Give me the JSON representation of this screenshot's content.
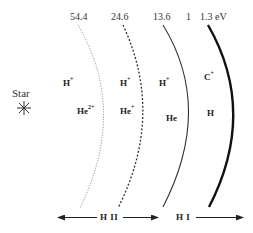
{
  "diagram": {
    "type": "ionization-front-structure",
    "source": {
      "label": "Star",
      "icon": "asterisk-star-icon",
      "glyph": "✳"
    },
    "fronts": [
      {
        "id": "front-54-4",
        "energy_label": "54.4",
        "style": "dotted",
        "weight": "thin",
        "color": "#777777"
      },
      {
        "id": "front-24-6",
        "energy_label": "24.6",
        "style": "dashed",
        "weight": "medium",
        "color": "#333333"
      },
      {
        "id": "front-13-6",
        "energy_label": "13.6",
        "style": "solid",
        "weight": "thin",
        "color": "#333333"
      },
      {
        "id": "front-1-3",
        "energy_label": "1.3 eV",
        "style": "solid",
        "weight": "thick",
        "color": "#111111"
      }
    ],
    "extra_top_label": "1",
    "zones": [
      {
        "id": "zone-1",
        "species": [
          {
            "base": "H",
            "charge": "+"
          },
          {
            "base": "He",
            "charge": "2+"
          }
        ]
      },
      {
        "id": "zone-2",
        "species": [
          {
            "base": "H",
            "charge": "+"
          },
          {
            "base": "He",
            "charge": "+"
          }
        ]
      },
      {
        "id": "zone-3",
        "species": [
          {
            "base": "H",
            "charge": "+"
          },
          {
            "base": "He",
            "charge": ""
          }
        ]
      },
      {
        "id": "zone-4",
        "species": [
          {
            "base": "C",
            "charge": "+"
          },
          {
            "base": "H",
            "charge": ""
          }
        ]
      }
    ],
    "regions": [
      {
        "id": "region-h2",
        "label": "H II",
        "direction": "both"
      },
      {
        "id": "region-h1",
        "label": "H I",
        "direction": "right"
      }
    ]
  }
}
